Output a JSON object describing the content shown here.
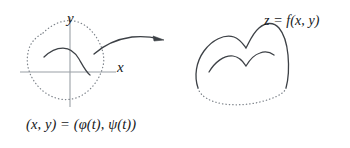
{
  "figure": {
    "background_color": "#ffffff",
    "curve_color": "#3d4146",
    "axis_color": "#9aa0a6",
    "dotted_color": "#7e848b",
    "text_color": "#16181a"
  },
  "left_panel": {
    "name": "domain-region-diagram",
    "axes": {
      "x_label": "x",
      "y_label": "y",
      "origin": [
        70,
        72
      ]
    },
    "boundary_style": "dotted",
    "interior_curve_style": "solid"
  },
  "arrow": {
    "name": "mapping-arrow",
    "style": "curved-solid-with-arrowhead",
    "direction": "left-to-right"
  },
  "right_panel": {
    "name": "surface-diagram",
    "equation": "z = f(x, y)",
    "top_outline_style": "solid",
    "bottom_outline_style": "dotted",
    "interior_curve_style": "solid"
  },
  "labels": {
    "surface_equation": "z = f(x, y)",
    "parametrization_lhs": "(x, y)",
    "parametrization_eq": "=",
    "parametrization_rhs": "(φ(t), ψ(t))",
    "parametrization_full": "(x, y) = (φ(t), ψ(t))"
  }
}
